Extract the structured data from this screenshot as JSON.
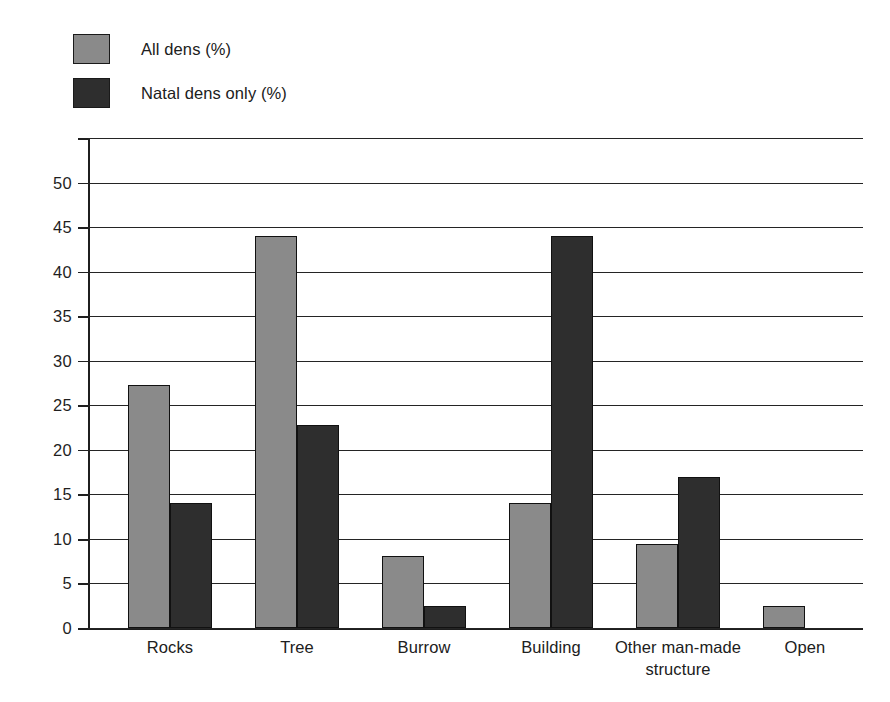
{
  "chart_data": {
    "type": "bar",
    "title": "",
    "xlabel": "",
    "ylabel": "",
    "ylim": [
      0,
      55
    ],
    "ytick_values": [
      0,
      5,
      10,
      15,
      20,
      25,
      30,
      35,
      40,
      45,
      50,
      55
    ],
    "ytick_labels": [
      "0",
      "5",
      "10",
      "15",
      "20",
      "25",
      "30",
      "35",
      "40",
      "45",
      "50",
      ""
    ],
    "grid": true,
    "legend_position": "top-left",
    "categories": [
      "Rocks",
      "Tree",
      "Burrow",
      "Building",
      "Other man-made structure",
      "Open"
    ],
    "series": [
      {
        "name": "All dens (%)",
        "color": "#8a8a8a",
        "values": [
          27.3,
          44.0,
          8.1,
          14.0,
          9.4,
          2.5
        ]
      },
      {
        "name": "Natal dens only (%)",
        "color": "#2e2e2e",
        "values": [
          14.0,
          22.8,
          2.5,
          44.0,
          17.0,
          0
        ]
      }
    ]
  },
  "legend": {
    "items": [
      {
        "label": "All dens (%)",
        "color": "#8a8a8a"
      },
      {
        "label": "Natal dens only (%)",
        "color": "#2e2e2e"
      }
    ]
  },
  "axes": {
    "y": {
      "labels": [
        "50",
        "45",
        "40",
        "35",
        "30",
        "25",
        "20",
        "15",
        "10",
        "5",
        "0"
      ]
    },
    "x": {
      "labels": [
        {
          "line1": "Rocks",
          "line2": ""
        },
        {
          "line1": "Tree",
          "line2": ""
        },
        {
          "line1": "Burrow",
          "line2": ""
        },
        {
          "line1": "Building",
          "line2": ""
        },
        {
          "line1": "Other man-made",
          "line2": "structure"
        },
        {
          "line1": "Open",
          "line2": ""
        }
      ]
    }
  }
}
